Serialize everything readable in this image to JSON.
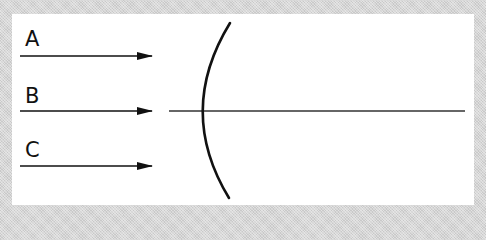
{
  "diagram": {
    "title": "",
    "rays": [
      {
        "label": "A"
      },
      {
        "label": "B"
      },
      {
        "label": "C"
      }
    ],
    "element": "concave-mirror",
    "colors": {
      "line": "#111111",
      "axis": "#333333",
      "panel": "#ffffff"
    }
  }
}
